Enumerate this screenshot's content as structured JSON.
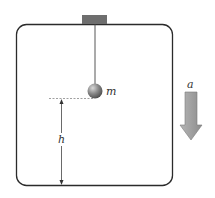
{
  "diagram": {
    "labels": {
      "mass": "m",
      "height": "h",
      "acceleration": "a"
    },
    "colors": {
      "box_stroke": "#2b2b2b",
      "mount_fill": "#6e6e6e",
      "ball_fill": "#7a7a7a",
      "arrow_fill": "#9a9a9a",
      "arrow_stroke": "#777777",
      "dashed_line": "#888888"
    },
    "acceleration_direction": "down"
  }
}
